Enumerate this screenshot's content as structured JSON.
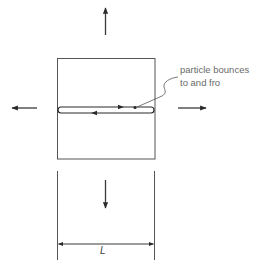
{
  "figure": {
    "annotation": {
      "line1": "particle bounces",
      "line2": "to and fro"
    },
    "dimension_label": "L",
    "elements": {
      "box": "square-container",
      "arrows": [
        "up",
        "left",
        "right",
        "down"
      ],
      "particle_path": "back-and-forth-loop"
    },
    "colors": {
      "stroke": "#3a3a3a",
      "text": "#6a6a6a",
      "background": "#ffffff"
    }
  }
}
